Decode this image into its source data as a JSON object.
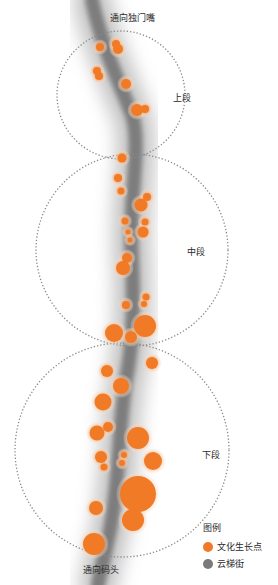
{
  "diagram": {
    "type": "street-node-map",
    "labels": {
      "top_entry": "通向独门嘴",
      "bottom_entry": "通向码头",
      "upper_section": "上段",
      "middle_section": "中段",
      "lower_section": "下段"
    },
    "legend": {
      "title": "图例",
      "items": [
        {
          "label": "文化生长点",
          "color": "#f07a26"
        },
        {
          "label": "云梯街",
          "color": "#7a7a7a"
        }
      ]
    },
    "colors": {
      "node_fill": "#f07a26",
      "node_halo": "#f6c9a6",
      "street": "#7d7d7d",
      "section_outline": "#8a8a8a"
    },
    "sections": [
      {
        "name": "上段",
        "cx": 121,
        "cy": 95,
        "r": 64
      },
      {
        "name": "中段",
        "cx": 132,
        "cy": 250,
        "r": 96
      },
      {
        "name": "下段",
        "cx": 122,
        "cy": 450,
        "r": 107
      }
    ],
    "street_path": "M 92 0 C 100 40, 118 80, 132 115 C 142 145, 128 200, 132 260 C 134 300, 134 340, 126 380 C 118 430, 120 480, 110 530 C 106 550, 102 565, 98 585",
    "nodes": [
      {
        "x": 100,
        "y": 47,
        "r": 4
      },
      {
        "x": 116,
        "y": 44,
        "r": 4
      },
      {
        "x": 118,
        "y": 49,
        "r": 5
      },
      {
        "x": 97,
        "y": 71,
        "r": 4
      },
      {
        "x": 99,
        "y": 76,
        "r": 4
      },
      {
        "x": 126,
        "y": 84,
        "r": 5
      },
      {
        "x": 137,
        "y": 110,
        "r": 6
      },
      {
        "x": 145,
        "y": 109,
        "r": 4
      },
      {
        "x": 122,
        "y": 158,
        "r": 4.5
      },
      {
        "x": 118,
        "y": 178,
        "r": 4
      },
      {
        "x": 121,
        "y": 191,
        "r": 3.5
      },
      {
        "x": 147,
        "y": 197,
        "r": 4
      },
      {
        "x": 141,
        "y": 205,
        "r": 6.5
      },
      {
        "x": 125,
        "y": 221,
        "r": 3.5
      },
      {
        "x": 145,
        "y": 222,
        "r": 3.5
      },
      {
        "x": 143,
        "y": 232,
        "r": 5.5
      },
      {
        "x": 128,
        "y": 232,
        "r": 2.5
      },
      {
        "x": 130,
        "y": 240,
        "r": 2.5
      },
      {
        "x": 127,
        "y": 258,
        "r": 5
      },
      {
        "x": 123,
        "y": 268,
        "r": 7
      },
      {
        "x": 126,
        "y": 305,
        "r": 4
      },
      {
        "x": 146,
        "y": 297,
        "r": 3.5
      },
      {
        "x": 144,
        "y": 304,
        "r": 3
      },
      {
        "x": 114,
        "y": 333,
        "r": 9
      },
      {
        "x": 131,
        "y": 337,
        "r": 6
      },
      {
        "x": 145,
        "y": 326,
        "r": 11
      },
      {
        "x": 152,
        "y": 363,
        "r": 6
      },
      {
        "x": 107,
        "y": 371,
        "r": 6
      },
      {
        "x": 121,
        "y": 386,
        "r": 8
      },
      {
        "x": 103,
        "y": 402,
        "r": 8.5
      },
      {
        "x": 108,
        "y": 427,
        "r": 5
      },
      {
        "x": 97,
        "y": 433,
        "r": 7.5
      },
      {
        "x": 138,
        "y": 438,
        "r": 11
      },
      {
        "x": 101,
        "y": 457,
        "r": 6
      },
      {
        "x": 104,
        "y": 467,
        "r": 3.5
      },
      {
        "x": 124,
        "y": 455,
        "r": 3
      },
      {
        "x": 122,
        "y": 463,
        "r": 3
      },
      {
        "x": 153,
        "y": 461,
        "r": 9
      },
      {
        "x": 138,
        "y": 494,
        "r": 18
      },
      {
        "x": 133,
        "y": 520,
        "r": 11
      },
      {
        "x": 96,
        "y": 508,
        "r": 7
      },
      {
        "x": 94,
        "y": 544,
        "r": 11
      }
    ]
  }
}
